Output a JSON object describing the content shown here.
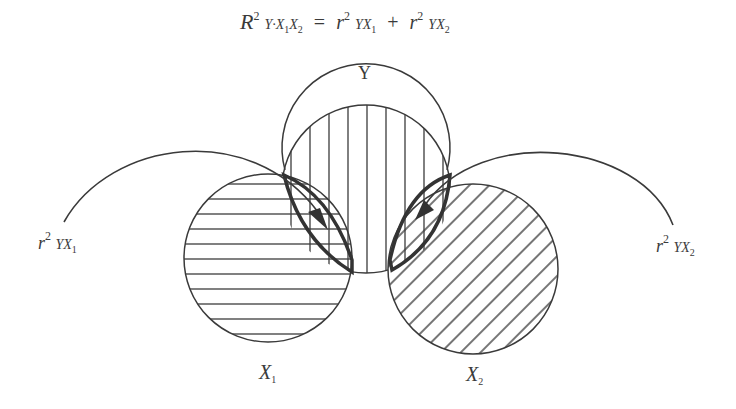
{
  "formula": {
    "lhs": "R",
    "lhs_sup": "2",
    "lhs_sub": "Y·X",
    "lhs_sub_1": "1",
    "lhs_sub_mid": "X",
    "lhs_sub_2": "2",
    "equals": "=",
    "term1": "r",
    "term1_sup": "2",
    "term1_sub": "YX",
    "term1_subsub": "1",
    "plus": "+",
    "term2": "r",
    "term2_sup": "2",
    "term2_sub": "YX",
    "term2_subsub": "2"
  },
  "circles": {
    "y": {
      "label": "Y",
      "hatch": "vertical"
    },
    "x1": {
      "label": "X",
      "label_sub": "1",
      "hatch": "horizontal"
    },
    "x2": {
      "label": "X",
      "label_sub": "2",
      "hatch": "diagonal"
    }
  },
  "annotations": {
    "left": {
      "r": "r",
      "sup": "2",
      "sub": "YX",
      "subsub": "1"
    },
    "right": {
      "r": "r",
      "sup": "2",
      "sub": "YX",
      "subsub": "2"
    }
  },
  "colors": {
    "line": "#3a3a3a",
    "bold_line": "#333333",
    "background": "#ffffff"
  }
}
